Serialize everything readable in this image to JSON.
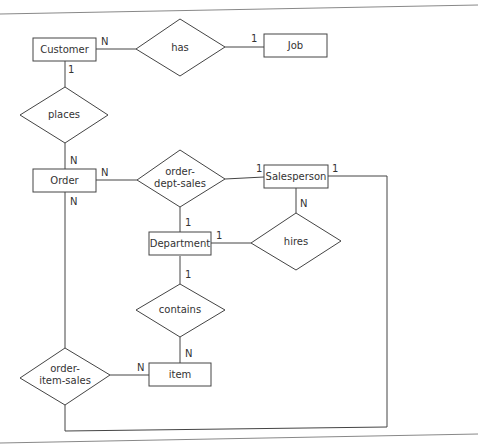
{
  "diagram": {
    "type": "ER diagram",
    "entities": [
      {
        "id": "customer",
        "label": "Customer"
      },
      {
        "id": "job",
        "label": "Job"
      },
      {
        "id": "order",
        "label": "Order"
      },
      {
        "id": "salesperson",
        "label": "Salesperson"
      },
      {
        "id": "department",
        "label": "Department"
      },
      {
        "id": "item",
        "label": "item"
      }
    ],
    "relationships": [
      {
        "id": "has",
        "lines": [
          "has"
        ]
      },
      {
        "id": "places",
        "lines": [
          "places"
        ]
      },
      {
        "id": "order_dept_sales",
        "lines": [
          "order-",
          "dept-sales"
        ]
      },
      {
        "id": "hires",
        "lines": [
          "hires"
        ]
      },
      {
        "id": "contains",
        "lines": [
          "contains"
        ]
      },
      {
        "id": "order_item_sales",
        "lines": [
          "order-",
          "item-sales"
        ]
      }
    ],
    "cardinalities": {
      "customer_has": "N",
      "job_has": "1",
      "customer_places": "1",
      "order_places": "N",
      "order_ods": "N",
      "salesperson_ods": "1",
      "department_ods": "1",
      "salesperson_hires": "N",
      "department_hires": "1",
      "department_contains": "1",
      "item_contains": "N",
      "order_ois": "N",
      "item_ois": "N",
      "salesperson_ois": "1"
    }
  }
}
